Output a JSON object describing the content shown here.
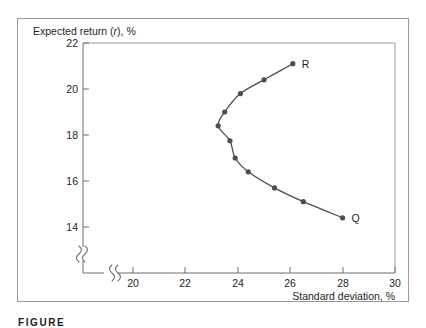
{
  "figure": {
    "caption_prefix": "FIGURE",
    "caption_number": "1"
  },
  "chart_data": {
    "type": "line",
    "title": "",
    "subtitle": "",
    "xlabel": "Standard deviation, %",
    "ylabel": "Expected return (r), %",
    "ylabel_parts": {
      "lead": "Expected return (",
      "italic": "r",
      "tail": "), %"
    },
    "xlim": [
      19,
      30
    ],
    "ylim": [
      13.1,
      22
    ],
    "x_ticks": [
      20,
      22,
      24,
      26,
      28,
      30
    ],
    "x_tick_labels": [
      "20",
      "22",
      "24",
      "26",
      "28",
      "30"
    ],
    "y_ticks": [
      14,
      16,
      18,
      20,
      22
    ],
    "y_tick_labels": [
      "14",
      "16",
      "18",
      "20",
      "22"
    ],
    "grid": false,
    "legend": "none",
    "axis_break_x": true,
    "axis_break_y": true,
    "series": [
      {
        "name": "Portfolio frontier",
        "marker": "filled-circle",
        "color": "#4d4d52",
        "x": [
          28.0,
          26.5,
          25.4,
          24.4,
          23.9,
          23.7,
          23.25,
          23.5,
          24.1,
          25.0,
          26.1
        ],
        "y": [
          14.4,
          15.1,
          15.7,
          16.4,
          17.0,
          17.75,
          18.4,
          19.0,
          19.8,
          20.4,
          21.1
        ]
      }
    ],
    "annotations": [
      {
        "label": "Q",
        "x": 28.0,
        "y": 14.4,
        "position": "right"
      },
      {
        "label": "R",
        "x": 26.1,
        "y": 21.1,
        "position": "right"
      }
    ]
  }
}
